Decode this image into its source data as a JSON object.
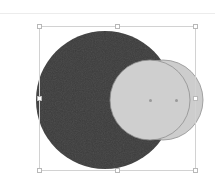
{
  "app": {
    "title": "Vector Canvas",
    "background_color": "#ffffff"
  },
  "toolbar": {
    "divider_color": "#ececec"
  },
  "canvas": {
    "label": "Drawing canvas",
    "width": 215,
    "height": 171
  },
  "shapes": [
    {
      "name": "large-dark-circle",
      "type": "circle",
      "cx": 105,
      "cy": 86,
      "r": 69,
      "fill": "#3c3c3c",
      "stroke": "none",
      "label": "Ellipse 1"
    },
    {
      "name": "light-circle-back",
      "type": "circle",
      "cx": 163,
      "cy": 86,
      "r": 40,
      "fill": "#cdcdcd",
      "stroke": "#8f8f8f",
      "label": "Ellipse 2"
    },
    {
      "name": "light-circle-front",
      "type": "circle",
      "cx": 150,
      "cy": 86,
      "r": 40,
      "fill": "#cfcfcf",
      "stroke": "#8f8f8f",
      "label": "Ellipse 3"
    }
  ],
  "selection": {
    "label": "Selection bounding box",
    "x": 39,
    "y": 12,
    "width": 157,
    "height": 145,
    "stroke_color": "#d2d2d2",
    "handle_fill": "#ffffff",
    "handle_stroke": "#b8b8b8",
    "handles": [
      "top-left",
      "top-center",
      "top-right",
      "middle-left",
      "middle-right",
      "bottom-left",
      "bottom-center",
      "bottom-right"
    ]
  },
  "center_markers": [
    {
      "name": "center-marker-front-circle",
      "x": 150,
      "y": 86
    },
    {
      "name": "center-marker-back-circle",
      "x": 176,
      "y": 86
    }
  ],
  "colors": {
    "dark_fill": "#3c3c3c",
    "light_fill": "#cdcdcd",
    "outline": "#8f8f8f",
    "selection": "#d2d2d2",
    "divider": "#ececec",
    "canvas_bg": "#ffffff"
  }
}
